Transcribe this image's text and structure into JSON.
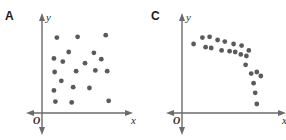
{
  "figure": {
    "title": "",
    "background_color": "#ffffff",
    "width": 286,
    "height": 140
  },
  "style": {
    "axis_color": "#6b6b6b",
    "dot_color": "#5a5a5a",
    "label_color": "#1a1a1a",
    "dot_radius": 2.4
  },
  "panels": [
    {
      "key": "a",
      "label": "A",
      "axis": {
        "x_label": "x",
        "y_label": "y",
        "origin_label": "O"
      }
    },
    {
      "key": "c",
      "label": "C",
      "axis": {
        "x_label": "x",
        "y_label": "y",
        "origin_label": "O"
      }
    }
  ],
  "chart_data": [
    {
      "type": "scatter",
      "panel": "A",
      "title": "A",
      "xlabel": "x",
      "ylabel": "y",
      "xlim": [
        0,
        100
      ],
      "ylim": [
        0,
        100
      ],
      "grid": false,
      "legend": null,
      "annotations": [
        "O"
      ],
      "pattern": "no correlation / random scatter",
      "points": [
        {
          "x": 12,
          "y": 88
        },
        {
          "x": 40,
          "y": 89
        },
        {
          "x": 78,
          "y": 91
        },
        {
          "x": 28,
          "y": 70
        },
        {
          "x": 62,
          "y": 69
        },
        {
          "x": 8,
          "y": 62
        },
        {
          "x": 72,
          "y": 61
        },
        {
          "x": 20,
          "y": 58
        },
        {
          "x": 50,
          "y": 56
        },
        {
          "x": 9,
          "y": 45
        },
        {
          "x": 38,
          "y": 46
        },
        {
          "x": 64,
          "y": 47
        },
        {
          "x": 80,
          "y": 46
        },
        {
          "x": 18,
          "y": 34
        },
        {
          "x": 34,
          "y": 26
        },
        {
          "x": 56,
          "y": 25
        },
        {
          "x": 8,
          "y": 22
        },
        {
          "x": 10,
          "y": 8
        },
        {
          "x": 32,
          "y": 7
        },
        {
          "x": 82,
          "y": 9
        }
      ]
    },
    {
      "type": "scatter",
      "panel": "C",
      "title": "C",
      "xlabel": "x",
      "ylabel": "y",
      "xlim": [
        0,
        100
      ],
      "ylim": [
        0,
        100
      ],
      "grid": false,
      "legend": null,
      "annotations": [
        "O"
      ],
      "pattern": "nonlinear, concave-down decreasing curve",
      "points": [
        {
          "x": 7,
          "y": 80
        },
        {
          "x": 18,
          "y": 88
        },
        {
          "x": 27,
          "y": 89
        },
        {
          "x": 22,
          "y": 76
        },
        {
          "x": 29,
          "y": 75
        },
        {
          "x": 37,
          "y": 85
        },
        {
          "x": 46,
          "y": 83
        },
        {
          "x": 42,
          "y": 72
        },
        {
          "x": 52,
          "y": 71
        },
        {
          "x": 57,
          "y": 80
        },
        {
          "x": 59,
          "y": 70
        },
        {
          "x": 67,
          "y": 78
        },
        {
          "x": 66,
          "y": 67
        },
        {
          "x": 73,
          "y": 65
        },
        {
          "x": 76,
          "y": 72
        },
        {
          "x": 72,
          "y": 54
        },
        {
          "x": 79,
          "y": 43
        },
        {
          "x": 86,
          "y": 45
        },
        {
          "x": 91,
          "y": 40
        },
        {
          "x": 82,
          "y": 31
        },
        {
          "x": 84,
          "y": 19
        },
        {
          "x": 86,
          "y": 5
        }
      ]
    }
  ]
}
